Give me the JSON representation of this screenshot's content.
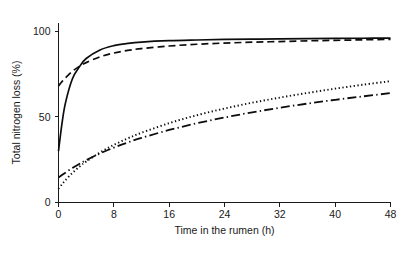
{
  "chart_data": {
    "type": "line",
    "title": "",
    "xlabel": "Time in the rumen (h)",
    "ylabel": "Total nitrogen loss (%)",
    "xlim": [
      0,
      48
    ],
    "ylim": [
      0,
      105
    ],
    "xticks": [
      0,
      8,
      16,
      24,
      32,
      40,
      48
    ],
    "yticks": [
      0,
      50,
      100
    ],
    "xticklabels": [
      "0",
      "8",
      "16",
      "24",
      "32",
      "40",
      "48"
    ],
    "yticklabels": [
      "0",
      "50",
      "100"
    ],
    "grid": false,
    "legend": "none",
    "x": [
      0,
      0.5,
      1,
      2,
      3,
      4,
      6,
      8,
      10,
      12,
      16,
      20,
      24,
      28,
      32,
      36,
      40,
      44,
      48
    ],
    "series": [
      {
        "name": "solid",
        "style": "solid",
        "values": [
          30,
          46,
          58,
          72,
          79,
          84,
          89,
          91.5,
          92.8,
          93.6,
          94.4,
          94.8,
          95.1,
          95.3,
          95.5,
          95.6,
          95.7,
          95.8,
          95.9
        ]
      },
      {
        "name": "dashed",
        "style": "dashed",
        "values": [
          68,
          70.5,
          72.7,
          76.5,
          79.4,
          81.6,
          85.0,
          87.2,
          88.7,
          89.8,
          91.3,
          92.3,
          93.0,
          93.5,
          93.9,
          94.3,
          94.6,
          94.9,
          95.2
        ]
      },
      {
        "name": "dotted",
        "style": "dotted",
        "values": [
          8,
          10.6,
          13.0,
          17.2,
          20.8,
          23.9,
          29.2,
          33.6,
          37.4,
          40.7,
          46.3,
          50.9,
          54.8,
          58.2,
          61.2,
          63.9,
          66.4,
          68.7,
          70.8
        ]
      },
      {
        "name": "dash-dot",
        "style": "dash-dot",
        "values": [
          14.5,
          16.0,
          17.4,
          20.1,
          22.5,
          24.7,
          28.6,
          32.0,
          35.0,
          37.7,
          42.3,
          46.2,
          49.6,
          52.6,
          55.3,
          57.7,
          59.9,
          61.9,
          63.8
        ]
      }
    ]
  },
  "style_tokens": {
    "line_color": "#0d0d0d",
    "axis_color": "#1a1a1a",
    "background": "#ffffff"
  }
}
